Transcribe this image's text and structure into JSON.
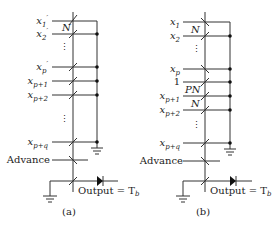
{
  "diagram_a": {
    "caption": "(a)",
    "inputs": [
      {
        "label": "x'1",
        "base": "x",
        "sub": "1",
        "prime": true
      },
      {
        "label": "x'2",
        "base": "x",
        "sub": "2",
        "prime": true
      },
      {
        "label": "x'p",
        "base": "x",
        "sub": "p",
        "prime": true
      },
      {
        "label": "xp+1",
        "base": "x",
        "sub": "p+1",
        "prime": false
      },
      {
        "label": "xp+2",
        "base": "x",
        "sub": "p+2",
        "prime": false
      },
      {
        "label": "xp+q",
        "base": "x",
        "sub": "p+q",
        "prime": false
      }
    ],
    "weight_labels": [
      "N"
    ],
    "advance_label": "Advance",
    "output_label": "Output = T",
    "output_sub": "b"
  },
  "diagram_b": {
    "caption": "(b)",
    "inputs": [
      {
        "label": "x1",
        "base": "x",
        "sub": "1"
      },
      {
        "label": "x2",
        "base": "x",
        "sub": "2"
      },
      {
        "label": "xp",
        "base": "x",
        "sub": "p"
      },
      {
        "label": "1",
        "base": "1",
        "sub": ""
      },
      {
        "label": "xp+1",
        "base": "x",
        "sub": "p+1"
      },
      {
        "label": "xp+2",
        "base": "x",
        "sub": "p+2"
      },
      {
        "label": "xp+q",
        "base": "x",
        "sub": "p+q"
      }
    ],
    "weight_labels": [
      "N",
      "PN",
      "N"
    ],
    "advance_label": "Advance",
    "output_label": "Output = T",
    "output_sub": "b"
  },
  "ellipsis": "⋮"
}
